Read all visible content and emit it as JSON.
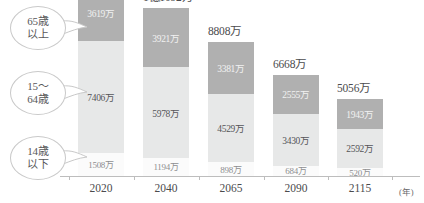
{
  "chart_data": {
    "type": "bar",
    "subtype": "stacked-bar",
    "title": "",
    "xlabel": "(年)",
    "ylabel": "",
    "unit": "万",
    "categories": [
      "2020",
      "2040",
      "2065",
      "2090",
      "2115"
    ],
    "totals": [
      "",
      "1億1092万",
      "8808万",
      "6668万",
      "5056万"
    ],
    "totals_values": [
      12530,
      11092,
      8808,
      6668,
      5056
    ],
    "ylim": [
      0,
      12530
    ],
    "grid": false,
    "legend_position": "left-callouts",
    "series": [
      {
        "name": "65歳以上",
        "color": "#b0b0b0",
        "values": [
          3619,
          3921,
          3381,
          2555,
          1943
        ],
        "labels": [
          "3619万",
          "3921万",
          "3381万",
          "2555万",
          "1943万"
        ]
      },
      {
        "name": "15〜64歳",
        "color": "#e7e8e8",
        "values": [
          7406,
          5978,
          4529,
          3430,
          2592
        ],
        "labels": [
          "7406万",
          "5978万",
          "4529万",
          "3430万",
          "2592万"
        ]
      },
      {
        "name": "14歳以下",
        "color": "#fbfbfb",
        "values": [
          1508,
          1194,
          898,
          684,
          520
        ],
        "labels": [
          "1508万",
          "1194万",
          "898万",
          "684万",
          "520万"
        ]
      }
    ]
  },
  "callouts": [
    {
      "line1": "65歳",
      "line2": "以上"
    },
    {
      "line1": "15〜",
      "line2": "64歳"
    },
    {
      "line1": "14歳",
      "line2": "以下"
    }
  ],
  "colors": {
    "elderly": "#b0b0b0",
    "working": "#e7e8e8",
    "children": "#fbfbfb",
    "axis": "#bdbdbd",
    "text": "#4b4b4d"
  }
}
